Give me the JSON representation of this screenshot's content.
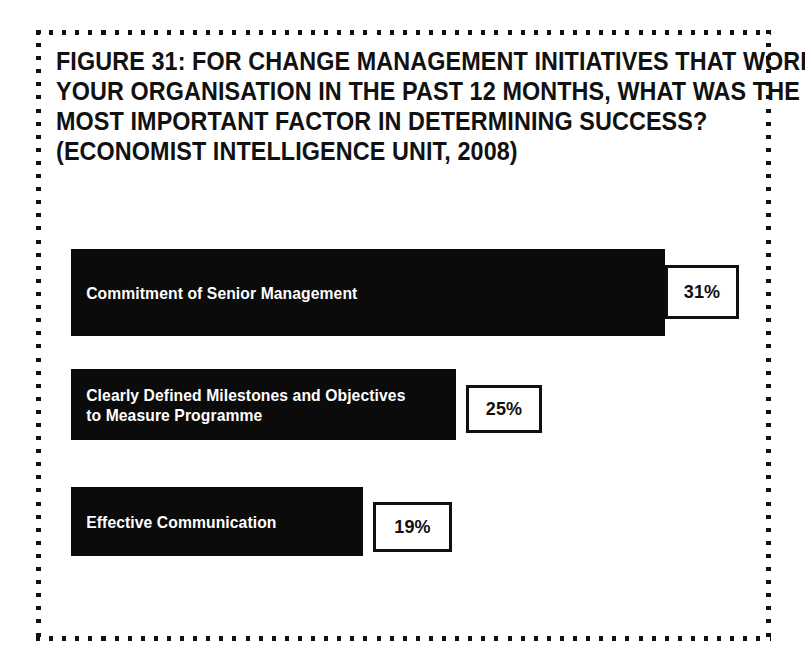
{
  "figure": {
    "title_lines": [
      "FIGURE 31: FOR CHANGE MANAGEMENT INITIATIVES THAT WORKED FOR",
      "YOUR ORGANISATION IN THE PAST 12 MONTHS, WHAT WAS THE SINGLE",
      "MOST IMPORTANT FACTOR IN DETERMINING SUCCESS?",
      "(ECONOMIST INTELLIGENCE UNIT, 2008)"
    ],
    "source": "(ECONOMIST INTELLIGENCE UNIT, 2008)",
    "bar_color": "#0b0b0b",
    "label_color": "#ffffff",
    "box_border_color": "#101010",
    "background_color": "#ffffff",
    "frame_dot_color": "#111111"
  },
  "chart_data": {
    "type": "bar",
    "orientation": "horizontal",
    "xlabel": "",
    "ylabel": "",
    "grid": false,
    "legend": false,
    "axis_visible": false,
    "value_suffix": "%",
    "categories": [
      "Commitment of Senior Management",
      "Clearly Defined Milestones and Objectives to Measure Programme",
      "Effective Communication"
    ],
    "values": [
      31,
      25,
      19
    ],
    "value_labels": [
      "31%",
      "25%",
      "19%"
    ],
    "bars": [
      {
        "label": "Commitment of Senior Management",
        "value": 31,
        "value_label": "31%"
      },
      {
        "label": "Clearly Defined Milestones and Objectives\nto Measure Programme",
        "value": 25,
        "value_label": "25%"
      },
      {
        "label": "Effective Communication",
        "value": 19,
        "value_label": "19%"
      }
    ]
  }
}
